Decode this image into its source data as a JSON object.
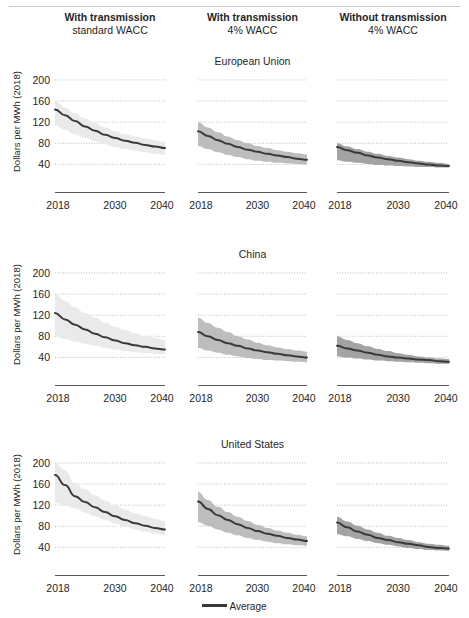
{
  "chart_data": {
    "type": "line",
    "title": "",
    "xlabel": "",
    "ylabel": "Dollars per MWh (2018)",
    "grid": true,
    "legend_position": "bottom",
    "legend": [
      "Average"
    ],
    "band_legend": "shaded range",
    "x": [
      2018,
      2020,
      2022,
      2024,
      2026,
      2028,
      2030,
      2032,
      2034,
      2036,
      2038,
      2040
    ],
    "xticks": [
      "2018",
      "2030",
      "2040"
    ],
    "xlim": [
      2018,
      2040
    ],
    "ylim": [
      20,
      215
    ],
    "yticks": [
      40,
      80,
      120,
      160,
      200
    ],
    "columns": [
      {
        "line1": "With transmission",
        "line2": "standard WACC",
        "band_color": "#eaeaea"
      },
      {
        "line1": "With transmission",
        "line2": "4% WACC",
        "band_color": "#bdbdbd"
      },
      {
        "line1": "Without transmission",
        "line2": "4% WACC",
        "band_color": "#a3a3a3"
      }
    ],
    "rows": [
      {
        "title": "European Union",
        "panels": [
          {
            "series": [
              {
                "name": "Average",
                "values": [
                  144,
                  133,
                  122,
                  112,
                  104,
                  96,
                  90,
                  85,
                  81,
                  77,
                  74,
                  71
                ]
              }
            ],
            "band_low": [
              114,
              105,
              97,
              90,
              84,
              78,
              73,
              69,
              66,
              63,
              60,
              58
            ],
            "band_high": [
              160,
              148,
              137,
              127,
              118,
              110,
              103,
              97,
              93,
              89,
              86,
              83
            ]
          },
          {
            "series": [
              {
                "name": "Average",
                "values": [
                  103,
                  94,
                  86,
                  79,
                  73,
                  68,
                  64,
                  60,
                  57,
                  54,
                  51,
                  49
                ]
              }
            ],
            "band_low": [
              75,
              69,
              63,
              58,
              54,
              50,
              47,
              45,
              43,
              42,
              41,
              40
            ],
            "band_high": [
              120,
              110,
              101,
              93,
              86,
              80,
              75,
              71,
              67,
              64,
              61,
              59
            ]
          },
          {
            "series": [
              {
                "name": "Average",
                "values": [
                  73,
                  67,
                  62,
                  57,
                  53,
                  50,
                  47,
                  44,
                  42,
                  40,
                  38,
                  37
                ]
              }
            ],
            "band_low": [
              48,
              45,
              43,
              41,
              39,
              38,
              37,
              36,
              35,
              35,
              34,
              34
            ],
            "band_high": [
              80,
              74,
              69,
              64,
              60,
              56,
              53,
              50,
              47,
              45,
              43,
              41
            ]
          }
        ]
      },
      {
        "title": "China",
        "panels": [
          {
            "series": [
              {
                "name": "Average",
                "values": [
                  124,
                  112,
                  102,
                  93,
                  85,
                  78,
                  72,
                  67,
                  63,
                  60,
                  57,
                  55
                ]
              }
            ],
            "band_low": [
              80,
              75,
              70,
              66,
              62,
              58,
              55,
              52,
              50,
              48,
              47,
              46
            ],
            "band_high": [
              160,
              147,
              135,
              124,
              115,
              106,
              98,
              92,
              86,
              81,
              77,
              73
            ]
          },
          {
            "series": [
              {
                "name": "Average",
                "values": [
                  88,
                  80,
                  73,
                  67,
                  62,
                  57,
                  53,
                  50,
                  47,
                  44,
                  42,
                  40
                ]
              }
            ],
            "band_low": [
              58,
              53,
              49,
              45,
              42,
              39,
              37,
              35,
              34,
              33,
              32,
              31
            ],
            "band_high": [
              115,
              105,
              96,
              88,
              80,
              74,
              68,
              63,
              59,
              56,
              53,
              51
            ]
          },
          {
            "series": [
              {
                "name": "Average",
                "values": [
                  62,
                  57,
                  53,
                  49,
                  45,
                  42,
                  40,
                  38,
                  36,
                  35,
                  33,
                  32
                ]
              }
            ],
            "band_low": [
              42,
              40,
              38,
              36,
              34,
              33,
              32,
              31,
              30,
              29,
              28,
              28
            ],
            "band_high": [
              80,
              73,
              67,
              61,
              56,
              52,
              48,
              45,
              42,
              40,
              38,
              37
            ]
          }
        ]
      },
      {
        "title": "United States",
        "panels": [
          {
            "series": [
              {
                "name": "Average",
                "values": [
                  177,
                  158,
                  137,
                  126,
                  116,
                  107,
                  99,
                  92,
                  86,
                  81,
                  77,
                  74
                ]
              }
            ],
            "band_low": [
              125,
              120,
              114,
              106,
              99,
              92,
              85,
              79,
              74,
              70,
              66,
              63
            ],
            "band_high": [
              200,
              186,
              162,
              150,
              139,
              129,
              120,
              112,
              105,
              99,
              94,
              90
            ]
          },
          {
            "series": [
              {
                "name": "Average",
                "values": [
                  127,
                  113,
                  101,
                  92,
                  84,
                  77,
                  71,
                  66,
                  62,
                  58,
                  55,
                  52
                ]
              }
            ],
            "band_low": [
              88,
              81,
              74,
              68,
              63,
              58,
              54,
              51,
              48,
              46,
              44,
              43
            ],
            "band_high": [
              145,
              130,
              117,
              107,
              98,
              90,
              83,
              77,
              72,
              68,
              64,
              61
            ]
          },
          {
            "series": [
              {
                "name": "Average",
                "values": [
                  87,
                  78,
                  70,
                  64,
                  58,
                  54,
                  50,
                  47,
                  44,
                  41,
                  39,
                  38
                ]
              }
            ],
            "band_low": [
              65,
              61,
              56,
              52,
              48,
              45,
              42,
              39,
              37,
              35,
              34,
              33
            ],
            "band_high": [
              98,
              89,
              81,
              74,
              68,
              62,
              58,
              54,
              50,
              47,
              45,
              43
            ]
          }
        ]
      }
    ]
  },
  "legend": {
    "average_label": "Average"
  }
}
